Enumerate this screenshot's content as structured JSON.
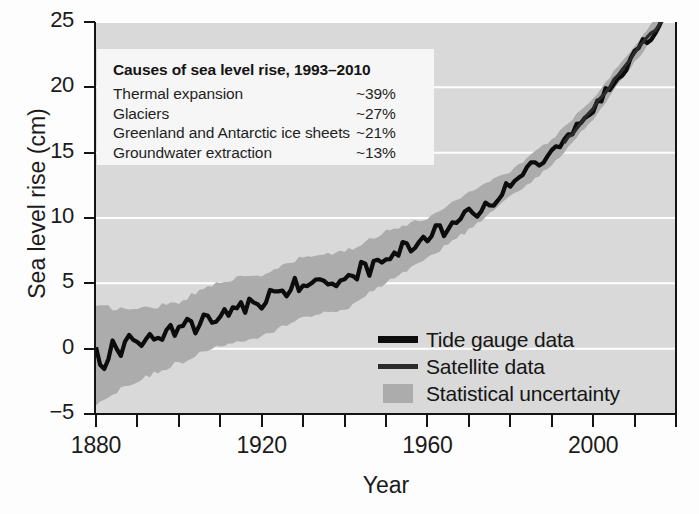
{
  "chart_data": {
    "type": "line",
    "title": "",
    "xlabel": "Year",
    "ylabel": "Sea level rise (cm)",
    "xlim": [
      1880,
      2020
    ],
    "ylim": [
      -5,
      25
    ],
    "xticks": [
      1880,
      1920,
      1960,
      2000
    ],
    "xtick_minor_step": 10,
    "yticks": [
      -5,
      0,
      5,
      10,
      15,
      20,
      25
    ],
    "grid": "horizontal-white",
    "legend_position": "bottom-right",
    "colors": {
      "tide_gauge_line": "#0c0c0c",
      "satellite_line": "#2b2b2b",
      "uncertainty_band": "#acacac",
      "plot_background": "#d9d9d9",
      "gridline": "#ffffff"
    },
    "series": [
      {
        "name": "Tide gauge data",
        "x": [
          1880,
          1882,
          1884,
          1886,
          1888,
          1890,
          1892,
          1894,
          1896,
          1898,
          1900,
          1902,
          1904,
          1906,
          1908,
          1910,
          1912,
          1914,
          1916,
          1918,
          1920,
          1922,
          1924,
          1926,
          1928,
          1930,
          1932,
          1934,
          1936,
          1938,
          1940,
          1942,
          1944,
          1946,
          1948,
          1950,
          1952,
          1954,
          1956,
          1958,
          1960,
          1962,
          1964,
          1966,
          1968,
          1970,
          1972,
          1974,
          1976,
          1978,
          1980,
          1982,
          1984,
          1986,
          1988,
          1990,
          1992,
          1994,
          1996,
          1998,
          2000,
          2002,
          2004,
          2006,
          2008,
          2010,
          2012,
          2014,
          2016,
          2018
        ],
        "values": [
          0.1,
          -1.9,
          0.2,
          -0.6,
          0.6,
          0.1,
          0.9,
          1.2,
          0.8,
          1.6,
          1.3,
          1.9,
          1.5,
          2.4,
          2.0,
          2.9,
          2.4,
          3.3,
          3.0,
          3.6,
          3.2,
          4.0,
          4.4,
          4.2,
          5.0,
          4.7,
          5.4,
          5.0,
          5.1,
          4.6,
          5.4,
          5.3,
          6.2,
          6.0,
          6.9,
          7.1,
          7.0,
          7.9,
          7.6,
          8.6,
          8.5,
          9.2,
          9.0,
          9.8,
          9.6,
          10.6,
          10.4,
          11.4,
          11.1,
          12.0,
          12.6,
          13.2,
          13.6,
          14.3,
          14.0,
          15.0,
          15.6,
          16.2,
          17.0,
          17.6,
          18.4,
          19.2,
          20.1,
          20.8,
          21.5,
          22.6,
          23.8,
          23.4,
          25.0,
          25.9
        ],
        "unit": "cm"
      },
      {
        "name": "Satellite data",
        "x": [
          1993,
          1995,
          1997,
          1999,
          2001,
          2003,
          2005,
          2007,
          2009,
          2011,
          2013,
          2015,
          2017,
          2019
        ],
        "values": [
          15.9,
          16.5,
          17.3,
          18.0,
          18.9,
          19.7,
          20.5,
          21.2,
          22.1,
          23.1,
          23.9,
          24.3,
          25.4,
          26.0
        ],
        "unit": "cm"
      }
    ],
    "uncertainty": {
      "name": "Statistical uncertainty",
      "x": [
        1880,
        1890,
        1900,
        1910,
        1920,
        1930,
        1940,
        1950,
        1960,
        1970,
        1980,
        1990,
        2000,
        2010,
        2018
      ],
      "lower": [
        -4.2,
        -2.4,
        -1.1,
        0.3,
        1.0,
        2.4,
        3.0,
        5.1,
        6.9,
        9.1,
        11.6,
        14.0,
        17.6,
        21.9,
        25.3
      ],
      "upper": [
        3.2,
        3.0,
        3.6,
        5.2,
        5.6,
        7.0,
        7.4,
        9.0,
        10.0,
        12.0,
        13.6,
        16.0,
        19.2,
        23.2,
        26.4
      ],
      "unit": "cm"
    }
  },
  "inset": {
    "title": "Causes of sea level rise, 1993–2010",
    "rows": [
      {
        "cause": "Thermal expansion",
        "pct": "~39%"
      },
      {
        "cause": "Glaciers",
        "pct": "~27%"
      },
      {
        "cause": "Greenland and Antarctic ice sheets",
        "pct": "~21%"
      },
      {
        "cause": "Groundwater extraction",
        "pct": "~13%"
      }
    ]
  },
  "legend": {
    "items": [
      {
        "label": "Tide gauge data",
        "swatch": "thick-black-line"
      },
      {
        "label": "Satellite data",
        "swatch": "dark-gray-line"
      },
      {
        "label": "Statistical uncertainty",
        "swatch": "gray-filled-square"
      }
    ]
  },
  "axes": {
    "y_title": "Sea level rise (cm)",
    "x_title": "Year",
    "ytick_labels": [
      "25",
      "20",
      "15",
      "10",
      "5",
      "0",
      "−5"
    ],
    "xtick_labels": [
      "1880",
      "1920",
      "1960",
      "2000"
    ]
  }
}
